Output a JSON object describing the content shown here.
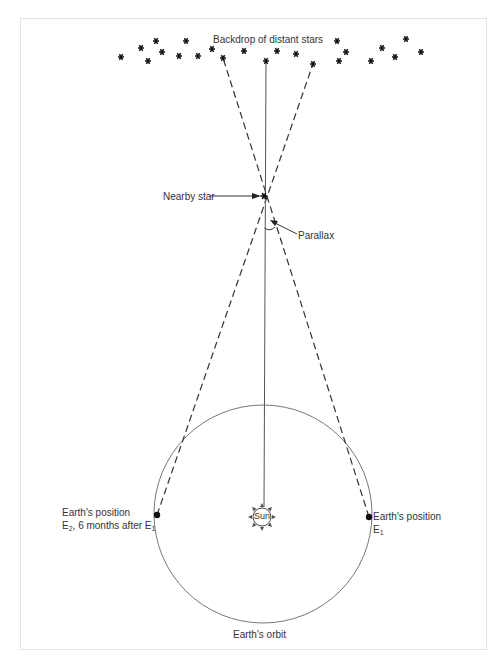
{
  "diagram": {
    "labels": {
      "backdrop": "Backdrop of distant stars",
      "nearby_star": "Nearby star",
      "parallax": "Parallax",
      "sun": "Sun",
      "earth_e2_line1": "Earth's position",
      "earth_e2_line2_prefix": "E",
      "earth_e2_line2_sub": "2",
      "earth_e2_line2_mid": ", 6 months after E",
      "earth_e2_line2_sub2": "1",
      "earth_e1_line1": "Earth's position",
      "earth_e1_line2_prefix": "E",
      "earth_e1_line2_sub": "1",
      "orbit": "Earth's orbit"
    },
    "colors": {
      "line": "#444444",
      "orbit": "#777777",
      "text": "#333333",
      "frame": "#e4e4e4"
    },
    "nodes": {
      "nearby_star": {
        "x": 264,
        "y": 196
      },
      "sun": {
        "x": 262,
        "y": 517
      },
      "earth_e1": {
        "x": 369,
        "y": 517
      },
      "earth_e2": {
        "x": 157,
        "y": 515
      },
      "orbit_center": {
        "x": 263,
        "y": 514,
        "r": 109
      }
    },
    "distant_stars": [
      [
        121,
        57
      ],
      [
        141,
        48
      ],
      [
        156,
        41
      ],
      [
        148,
        61
      ],
      [
        162,
        52
      ],
      [
        179,
        56
      ],
      [
        186,
        41
      ],
      [
        198,
        56
      ],
      [
        212,
        49
      ],
      [
        223,
        58
      ],
      [
        244,
        51
      ],
      [
        266,
        61
      ],
      [
        277,
        51
      ],
      [
        296,
        54
      ],
      [
        313,
        64
      ],
      [
        337,
        41
      ],
      [
        346,
        52
      ],
      [
        339,
        61
      ],
      [
        371,
        61
      ],
      [
        382,
        48
      ],
      [
        395,
        57
      ],
      [
        406,
        39
      ],
      [
        421,
        52
      ]
    ],
    "sight_lines": [
      {
        "name": "from-e2",
        "from": [
          157,
          515
        ],
        "to": [
          313,
          64
        ],
        "style": "dashed"
      },
      {
        "name": "from-e1",
        "from": [
          369,
          517
        ],
        "to": [
          223,
          58
        ],
        "style": "dashed"
      },
      {
        "name": "sun-to-star",
        "from": [
          263,
          508
        ],
        "to": [
          266,
          61
        ],
        "style": "solid"
      }
    ]
  }
}
